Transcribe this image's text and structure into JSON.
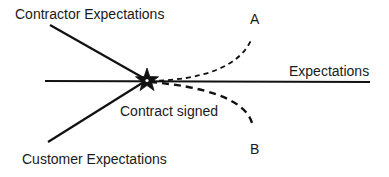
{
  "diagram": {
    "labels": {
      "contractor": "Contractor Expectations",
      "customer": "Customer Expectations",
      "expectations": "Expectations",
      "contract_signed": "Contract signed",
      "outcome_a": "A",
      "outcome_b": "B"
    },
    "colors": {
      "line": "#111111",
      "text": "#1a1a1a",
      "background": "#ffffff"
    }
  }
}
